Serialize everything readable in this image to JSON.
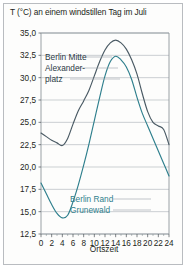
{
  "title": "T (°C) an einem windstillen Tag im Juli",
  "axis": {
    "xlabel": "Ortszeit",
    "yticks": [
      "35,0",
      "32,5",
      "30,0",
      "27,5",
      "25,0",
      "22,5",
      "20,0",
      "17,5",
      "15,0",
      "12,5"
    ],
    "xticks": [
      "0",
      "2",
      "4",
      "6",
      "8",
      "10",
      "12",
      "14",
      "16",
      "18",
      "20",
      "22",
      "24"
    ]
  },
  "legend": {
    "dark": [
      "Berlin Mitte",
      "Alexander-",
      "platz"
    ],
    "teal": [
      "Berlin Rand",
      "Grunewald"
    ]
  },
  "colors": {
    "dark_curve": "#4a5a64",
    "teal_curve": "#2e7f8d",
    "grid": "#b6bcc0",
    "frame": "#b9bcc0",
    "text": "#231f20"
  },
  "chart_data": {
    "type": "line",
    "title": "T (°C) an einem windstillen Tag im Juli",
    "xlabel": "Ortszeit",
    "ylabel": "T (°C)",
    "xlim": [
      0,
      24
    ],
    "ylim": [
      12.5,
      35.0
    ],
    "ytick_step": 2.5,
    "xtick_step": 2,
    "xminor_step": 1,
    "grid": true,
    "legend_position": "inline-annotation",
    "x": [
      0,
      1,
      2,
      3,
      4,
      5,
      6,
      7,
      8,
      9,
      10,
      11,
      12,
      13,
      14,
      15,
      16,
      17,
      18,
      19,
      20,
      21,
      22,
      23,
      24
    ],
    "series": [
      {
        "name": "Berlin Mitte Alexanderplatz",
        "color": "#4a5a64",
        "values": [
          23.8,
          23.4,
          23.0,
          22.7,
          22.4,
          23.2,
          24.8,
          26.3,
          27.4,
          28.6,
          30.2,
          31.8,
          33.1,
          33.9,
          34.2,
          33.9,
          33.2,
          32.0,
          30.4,
          28.2,
          26.2,
          25.0,
          24.6,
          24.2,
          22.5
        ]
      },
      {
        "name": "Berlin Rand Grunewald",
        "color": "#2e7f8d",
        "values": [
          18.2,
          17.0,
          15.8,
          14.8,
          14.3,
          14.6,
          16.1,
          18.0,
          20.2,
          22.6,
          25.2,
          27.8,
          30.2,
          31.8,
          32.4,
          32.0,
          31.2,
          29.8,
          27.8,
          26.0,
          24.6,
          23.2,
          21.8,
          20.4,
          19.0
        ]
      }
    ]
  }
}
